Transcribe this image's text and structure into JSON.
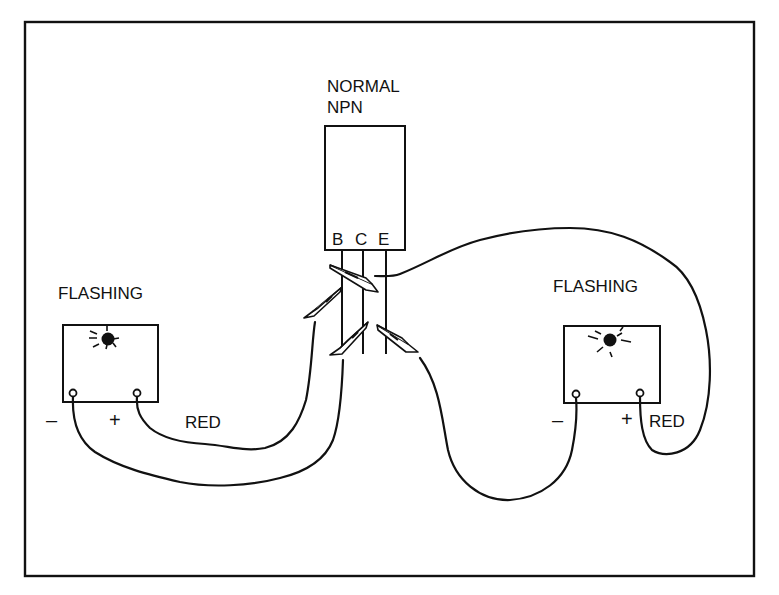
{
  "diagram": {
    "transistor": {
      "label_line1": "NORMAL",
      "label_line2": "NPN",
      "pins": [
        {
          "id": "base",
          "label": "B"
        },
        {
          "id": "collector",
          "label": "C"
        },
        {
          "id": "emitter",
          "label": "E"
        }
      ]
    },
    "left_module": {
      "label": "FLASHING",
      "minus_label": "–",
      "plus_label": "+",
      "wire_label": "RED"
    },
    "right_module": {
      "label": "FLASHING",
      "minus_label": "–",
      "plus_label": "+",
      "wire_label": "RED"
    },
    "colors": {
      "ink": "#111111",
      "background": "#ffffff"
    }
  }
}
